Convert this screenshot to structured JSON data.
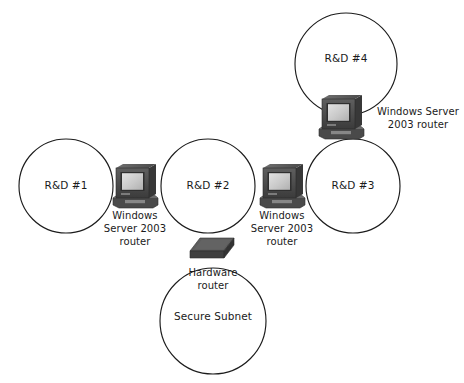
{
  "diagram": {
    "type": "network-topology",
    "canvas": {
      "width": 464,
      "height": 383
    },
    "colors": {
      "background": "#ffffff",
      "stroke": "#1c1c1c",
      "text": "#1a1a1a",
      "router_body_dark": "#3a3a3a",
      "router_body_mid": "#555555",
      "router_body_light": "#6e6e6e",
      "router_screen": "#cfcfcf",
      "hardware_router_top": "#5a5a5a",
      "hardware_router_side": "#3c3c3c"
    },
    "subnets": [
      {
        "id": "rd1",
        "label": "R&D #1",
        "cx": 66,
        "cy": 186,
        "r": 47
      },
      {
        "id": "rd2",
        "label": "R&D #2",
        "cx": 208,
        "cy": 186,
        "r": 47
      },
      {
        "id": "rd3",
        "label": "R&D #3",
        "cx": 353,
        "cy": 186,
        "r": 47
      },
      {
        "id": "rd4",
        "label": "R&D #4",
        "cx": 346,
        "cy": 64,
        "r": 51
      },
      {
        "id": "secure",
        "label": "Secure Subnet",
        "cx": 213,
        "cy": 321,
        "r": 53
      }
    ],
    "routers": [
      {
        "id": "router-1-2",
        "kind": "windows-server-router",
        "icon": "crt-computer-icon",
        "label": "Windows\nServer 2003\nrouter",
        "label_lines": [
          "Windows",
          "Server 2003",
          "router"
        ],
        "connects": [
          "R&D #1",
          "R&D #2"
        ],
        "x": 111,
        "y": 162,
        "w": 47,
        "h": 46,
        "label_x": 100,
        "label_y": 209,
        "label_w": 70
      },
      {
        "id": "router-2-3",
        "kind": "windows-server-router",
        "icon": "crt-computer-icon",
        "label": "Windows\nServer 2003\nrouter",
        "label_lines": [
          "Windows",
          "Server 2003",
          "router"
        ],
        "connects": [
          "R&D #2",
          "R&D #3"
        ],
        "x": 258,
        "y": 162,
        "w": 47,
        "h": 46,
        "label_x": 247,
        "label_y": 209,
        "label_w": 70
      },
      {
        "id": "router-3-4",
        "kind": "windows-server-router",
        "icon": "crt-computer-icon",
        "label": "Windows Server\n2003 router",
        "label_lines": [
          "Windows Server",
          "2003 router"
        ],
        "connects": [
          "R&D #4",
          "R&D #3"
        ],
        "x": 317,
        "y": 93,
        "w": 47,
        "h": 46,
        "label_x": 374,
        "label_y": 105,
        "label_w": 88
      },
      {
        "id": "router-hardware",
        "kind": "hardware-router",
        "icon": "hardware-router-icon",
        "label": "Hardware\nrouter",
        "label_lines": [
          "Hardware",
          "router"
        ],
        "connects": [
          "R&D #2",
          "Secure Subnet"
        ],
        "x": 190,
        "y": 238,
        "w": 44,
        "h": 25,
        "label_x": 178,
        "label_y": 266,
        "label_w": 70
      }
    ]
  }
}
